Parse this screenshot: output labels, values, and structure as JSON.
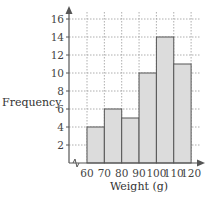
{
  "chart_data": {
    "type": "histogram",
    "title": "",
    "xlabel": "Weight (g)",
    "ylabel": "Frequency",
    "bins": [
      [
        60,
        70
      ],
      [
        70,
        80
      ],
      [
        80,
        90
      ],
      [
        90,
        100
      ],
      [
        100,
        110
      ],
      [
        110,
        120
      ]
    ],
    "categories": [
      "60-70",
      "70-80",
      "80-90",
      "90-100",
      "100-110",
      "110-120"
    ],
    "values": [
      4,
      6,
      5,
      10,
      14,
      11
    ],
    "x_ticks": [
      60,
      70,
      80,
      90,
      100,
      110,
      120
    ],
    "y_ticks": [
      2,
      4,
      6,
      8,
      10,
      12,
      14,
      16
    ],
    "ylim": [
      0,
      17
    ],
    "xlim": [
      50,
      122
    ],
    "grid": true,
    "axis_break": true,
    "bar_color": "#dcdcdc",
    "bar_edge": "#555555"
  },
  "labels": {
    "xlabel": "Weight (g)",
    "ylabel": "Frequency"
  }
}
